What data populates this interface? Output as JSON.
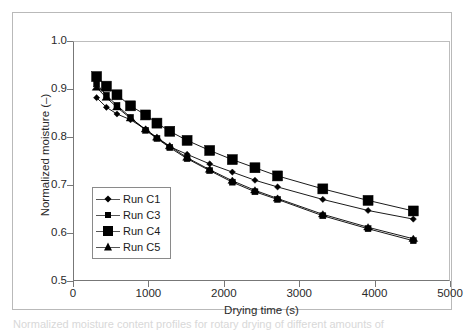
{
  "figure": {
    "caption_fragment": "Normalized moisture content profiles for rotary drying of different amounts of",
    "background_color": "#ffffff",
    "frame_color": "#b9b9b9"
  },
  "axes": {
    "x": {
      "title": "Drying time (s)",
      "ticks": [
        0,
        1000,
        2000,
        3000,
        4000,
        5000
      ],
      "tick_labels": [
        "0",
        "1000",
        "2000",
        "3000",
        "4000",
        "5000"
      ],
      "min": 0,
      "max": 5000
    },
    "y": {
      "title": "Normalized moisture (–)",
      "ticks": [
        0.5,
        0.6,
        0.7,
        0.8,
        0.9,
        1.0
      ],
      "tick_labels": [
        "0.5",
        "0.6",
        "0.7",
        "0.8",
        "0.9",
        "1.0"
      ],
      "min": 0.5,
      "max": 1.0
    }
  },
  "legend": {
    "position": "inside-lower-left",
    "entries": [
      {
        "label": "Run C1",
        "marker": "diamond",
        "marker_class": "mk-diamond",
        "color": "#000000"
      },
      {
        "label": "Run C3",
        "marker": "square-small",
        "marker_class": "mk-sq-small",
        "color": "#000000"
      },
      {
        "label": "Run C4",
        "marker": "square-large",
        "marker_class": "mk-sq-large",
        "color": "#000000"
      },
      {
        "label": "Run C5",
        "marker": "triangle",
        "marker_class": "mk-tri",
        "color": "#000000"
      }
    ]
  },
  "chart_data": {
    "type": "line",
    "title": "",
    "xlabel": "Drying time (s)",
    "ylabel": "Normalized moisture (–)",
    "xlim": [
      0,
      5000
    ],
    "ylim": [
      0.5,
      1.0
    ],
    "grid": false,
    "legend_position": "inside-lower-left",
    "marker_line_color": "#000000",
    "series": [
      {
        "name": "Run C1",
        "marker": "diamond",
        "marker_size": 5,
        "x": [
          300,
          430,
          570,
          750,
          950,
          1100,
          1270,
          1500,
          1800,
          2100,
          2400,
          2700,
          3300,
          3900,
          4500
        ],
        "y": [
          0.884,
          0.864,
          0.85,
          0.838,
          0.818,
          0.8,
          0.782,
          0.766,
          0.746,
          0.729,
          0.712,
          0.698,
          0.672,
          0.649,
          0.631
        ]
      },
      {
        "name": "Run C3",
        "marker": "square-small",
        "marker_size": 6,
        "x": [
          300,
          430,
          570,
          750,
          950,
          1100,
          1270,
          1500,
          1800,
          2100,
          2400,
          2700,
          3300,
          3900,
          4500
        ],
        "y": [
          0.913,
          0.889,
          0.868,
          0.843,
          0.816,
          0.799,
          0.78,
          0.757,
          0.732,
          0.708,
          0.688,
          0.672,
          0.638,
          0.611,
          0.586
        ]
      },
      {
        "name": "Run C4",
        "marker": "square-large",
        "marker_size": 10,
        "x": [
          300,
          430,
          570,
          750,
          950,
          1100,
          1270,
          1500,
          1800,
          2100,
          2400,
          2700,
          3300,
          3900,
          4500
        ],
        "y": [
          0.928,
          0.908,
          0.89,
          0.867,
          0.848,
          0.831,
          0.814,
          0.795,
          0.774,
          0.755,
          0.738,
          0.721,
          0.694,
          0.67,
          0.648
        ]
      },
      {
        "name": "Run C5",
        "marker": "triangle",
        "marker_size": 8,
        "x": [
          300,
          430,
          570,
          750,
          950,
          1100,
          1270,
          1500,
          1800,
          2100,
          2400,
          2700,
          3300,
          3900,
          4500
        ],
        "y": [
          0.905,
          0.884,
          0.864,
          0.841,
          0.818,
          0.801,
          0.783,
          0.759,
          0.734,
          0.711,
          0.691,
          0.674,
          0.641,
          0.614,
          0.59
        ]
      }
    ]
  }
}
